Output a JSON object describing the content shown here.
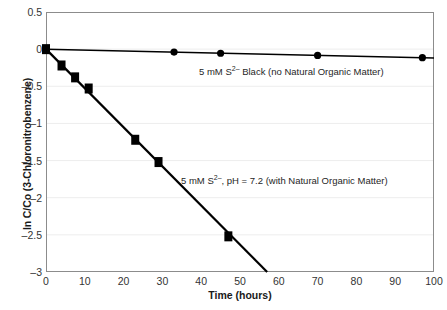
{
  "chart_data": {
    "type": "scatter",
    "title": "",
    "xlabel": "Time (hours)",
    "ylabel": "ln C/Co (3-Chloronitrobenzene)",
    "xlim": [
      0,
      100
    ],
    "ylim": [
      -3,
      0.5
    ],
    "xticks": [
      0,
      10,
      20,
      30,
      40,
      50,
      60,
      70,
      80,
      90,
      100
    ],
    "xtick_labels": [
      "0",
      "10",
      "20",
      "30",
      "40",
      "50",
      "60",
      "70",
      "80",
      "90",
      "100"
    ],
    "yticks": [
      0.5,
      0,
      -0.5,
      -1,
      -1.5,
      -2,
      -2.5,
      -3
    ],
    "ytick_labels": [
      "0.5",
      "0",
      "–0.5",
      "–1",
      "–1.5",
      "–2",
      "–2.5",
      "–3"
    ],
    "grid": "horizontal-faint",
    "legend_position": "inline-annotations",
    "series": [
      {
        "name": "5 mM S2- Black (no Natural Organic Matter)",
        "marker": "circle",
        "color": "#000000",
        "x": [
          0,
          33,
          45,
          70,
          97
        ],
        "y": [
          0,
          -0.04,
          -0.055,
          -0.085,
          -0.115
        ],
        "fit_line": {
          "x": [
            0,
            100
          ],
          "y": [
            0.0,
            -0.12
          ]
        }
      },
      {
        "name": "5 mM S2-, pH = 7.2 (with Natural Organic Matter)",
        "marker": "square",
        "color": "#000000",
        "x": [
          0,
          4,
          7.5,
          11,
          23,
          29,
          47
        ],
        "y": [
          0,
          -0.22,
          -0.38,
          -0.53,
          -1.22,
          -1.52,
          -2.52
        ],
        "fit_line": {
          "x": [
            0,
            57
          ],
          "y": [
            0.0,
            -3.0
          ]
        }
      }
    ]
  },
  "annotations": {
    "top": {
      "prefix": "5 mM S",
      "sup": "2–",
      "suffix": " Black (no Natural Organic Matter)"
    },
    "bottom": {
      "prefix": "5 mM S",
      "sup": "2–",
      "suffix": ", pH = 7.2 (with Natural Organic Matter)"
    }
  },
  "colors": {
    "axis": "#8c8c8c",
    "grid": "#ededed",
    "data": "#000000",
    "text": "#1a1a1a"
  }
}
